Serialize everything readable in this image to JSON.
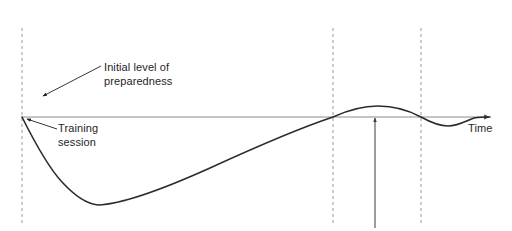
{
  "diagram": {
    "type": "line",
    "title": "",
    "background_color": "#ffffff",
    "axis": {
      "baseline_label": "Time",
      "baseline_color": "#8c8c8c",
      "baseline_y": 117,
      "baseline_x_start": 22,
      "baseline_x_end": 492,
      "arrowhead": "right-arrow-icon"
    },
    "curve": {
      "color": "#2b2b2b",
      "stroke_width": 1.6,
      "description": "preparedness-over-time-curve",
      "points": [
        {
          "x": 22,
          "y": 117
        },
        {
          "x": 40,
          "y": 150
        },
        {
          "x": 60,
          "y": 178
        },
        {
          "x": 80,
          "y": 198
        },
        {
          "x": 97,
          "y": 205
        },
        {
          "x": 120,
          "y": 202
        },
        {
          "x": 150,
          "y": 193
        },
        {
          "x": 200,
          "y": 173
        },
        {
          "x": 250,
          "y": 152
        },
        {
          "x": 300,
          "y": 130
        },
        {
          "x": 333,
          "y": 117
        },
        {
          "x": 350,
          "y": 110
        },
        {
          "x": 378,
          "y": 106
        },
        {
          "x": 400,
          "y": 109
        },
        {
          "x": 421,
          "y": 117
        },
        {
          "x": 435,
          "y": 124
        },
        {
          "x": 448,
          "y": 126
        },
        {
          "x": 460,
          "y": 122
        },
        {
          "x": 470,
          "y": 118
        },
        {
          "x": 490,
          "y": 117
        }
      ]
    },
    "dashed_lines": {
      "color": "#9a9a9a",
      "dash_pattern": "3 3",
      "y_top": 28,
      "y_bottom": 226,
      "x_positions": [
        22,
        333,
        421
      ]
    },
    "marker_arrow": {
      "name": "upward-marker-arrow",
      "color": "#4a4a4a",
      "x": 375,
      "y_bottom": 228,
      "y_tip": 116
    },
    "annotations": [
      {
        "id": "initial-level-of-preparedness",
        "lines": [
          "Initial level of",
          "preparedness"
        ],
        "text_x": 104,
        "text_y": 60,
        "leader": {
          "from_x": 101,
          "from_y": 66,
          "to_x": 41,
          "to_y": 97,
          "arrowhead": "down-left-arrow-icon"
        }
      },
      {
        "id": "training-session",
        "lines": [
          "Training",
          "session"
        ],
        "text_x": 58,
        "text_y": 121,
        "leader": {
          "from_x": 57,
          "from_y": 129,
          "to_x": 25,
          "to_y": 118,
          "arrowhead": "up-left-arrow-icon"
        }
      }
    ]
  },
  "labels": {
    "initial_level_line1": "Initial level of",
    "initial_level_line2": "preparedness",
    "training_line1": "Training",
    "training_line2": "session",
    "time_axis": "Time"
  }
}
